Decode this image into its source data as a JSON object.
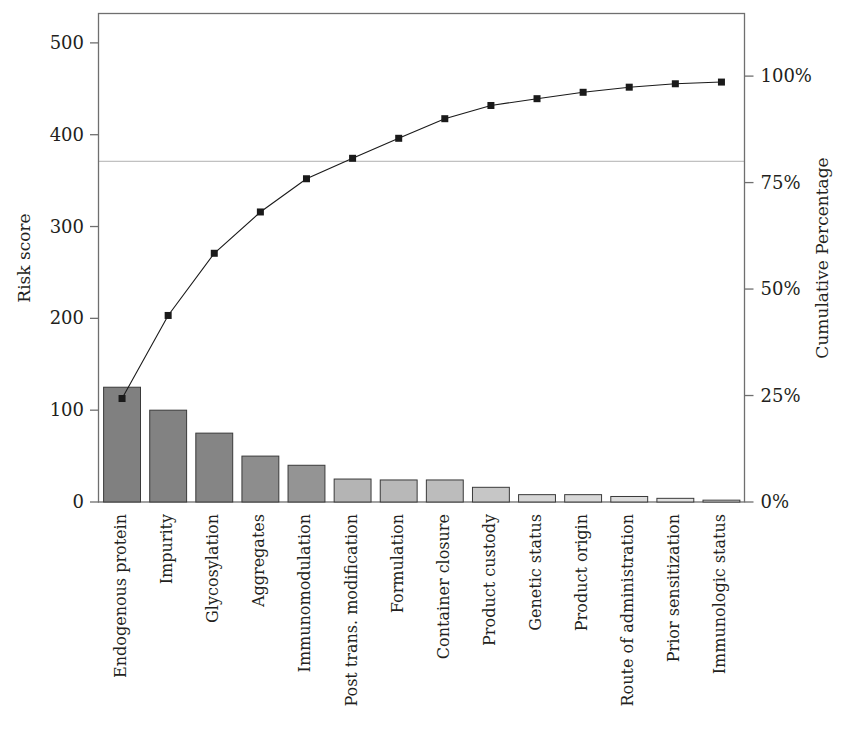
{
  "chart_data": {
    "type": "bar",
    "title": "",
    "subtitle": "",
    "xlabel": "",
    "ylabel": "Risk score",
    "y2label": "Cumulative Percentage",
    "ylim": [
      0,
      532
    ],
    "y2lim": [
      0,
      114.7
    ],
    "grid": false,
    "legend": "none",
    "annotations": [
      {
        "name": "eighty-percent-reference-line",
        "type": "hline",
        "y_percent": 80,
        "label": ""
      }
    ],
    "categories": [
      "Endogenous protein",
      "Impurity",
      "Glycosylation",
      "Aggregates",
      "Immunomodulation",
      "Post trans. modification",
      "Formulation",
      "Container closure",
      "Product custody",
      "Genetic status",
      "Product origin",
      "Route of administration",
      "Prior sensitization",
      "Immunologic status"
    ],
    "series": [
      {
        "name": "Risk score",
        "kind": "bar",
        "values": [
          125,
          100,
          75,
          50,
          40,
          25,
          24,
          24,
          16,
          8,
          8,
          6,
          4,
          2
        ],
        "bar_colors": [
          "#808080",
          "#828282",
          "#858585",
          "#8d8d8d",
          "#949494",
          "#b4b4b4",
          "#b8b8b8",
          "#bcbcbc",
          "#c6c6c6",
          "#d6d6d6",
          "#d8d8d8",
          "#dcdcdc",
          "#e0e0e0",
          "#e6e6e6"
        ],
        "bar_edge_color": "#3a3a3a"
      },
      {
        "name": "Cumulative Percentage",
        "kind": "line",
        "axis": "right",
        "values": [
          24.3,
          43.8,
          58.4,
          68.1,
          75.9,
          80.7,
          85.4,
          90.0,
          93.1,
          94.7,
          96.2,
          97.4,
          98.2,
          98.6
        ],
        "line_color": "#1a1a1a",
        "marker": "square",
        "marker_color": "#1a1a1a"
      }
    ],
    "y_ticks": [
      0,
      100,
      200,
      300,
      400,
      500
    ],
    "y_tick_labels": [
      "0",
      "100",
      "200",
      "300",
      "400",
      "500"
    ],
    "y2_ticks": [
      0,
      25,
      50,
      75,
      100
    ],
    "y2_tick_labels": [
      "0%",
      "25%",
      "50%",
      "75%",
      "100%"
    ]
  },
  "style": {
    "frame_color": "#6f6f6f",
    "ref_line_color": "#b0b0b0",
    "background": "#ffffff",
    "text_color": "#231f20"
  }
}
